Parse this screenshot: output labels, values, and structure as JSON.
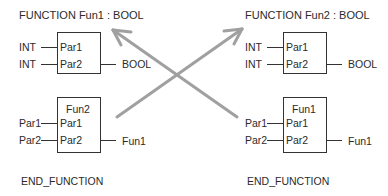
{
  "left": {
    "header": "FUNCTION  Fun1 : BOOL",
    "decl_block": {
      "inputs": [
        {
          "type": "INT",
          "pin": "Par1"
        },
        {
          "type": "INT",
          "pin": "Par2"
        }
      ],
      "output": "BOOL"
    },
    "call_block": {
      "name": "Fun2",
      "inputs": [
        {
          "var": "Par1",
          "pin": "Par1"
        },
        {
          "var": "Par2",
          "pin": "Par2"
        }
      ],
      "output": "Fun1"
    },
    "footer": "END_FUNCTION"
  },
  "right": {
    "header": "FUNCTION  Fun2 : BOOL",
    "decl_block": {
      "inputs": [
        {
          "type": "INT",
          "pin": "Par1"
        },
        {
          "type": "INT",
          "pin": "Par2"
        }
      ],
      "output": "BOOL"
    },
    "call_block": {
      "name": "Fun1",
      "inputs": [
        {
          "var": "Par1",
          "pin": "Par1"
        },
        {
          "var": "Par2",
          "pin": "Par2"
        }
      ],
      "output": "Fun1"
    },
    "footer": "END_FUNCTION"
  },
  "colors": {
    "line": "#333333",
    "arrow": "#a0a0a0",
    "text": "#2b2b2b"
  }
}
